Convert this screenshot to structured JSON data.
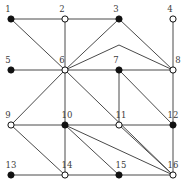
{
  "figure": {
    "width": 194,
    "height": 188,
    "background_color": "#ffffff",
    "edge_color": "#4a4a4a",
    "node_outline_color": "#111111",
    "node_fill_color": "#111111",
    "node_open_color": "#ffffff",
    "label_color": "#3c3c3c"
  },
  "chart_data": {
    "type": "scatter",
    "title": "",
    "xlabel": "",
    "ylabel": "",
    "grid": false,
    "legend": false,
    "nodes": [
      {
        "id": 1,
        "label": "1",
        "x": 11,
        "y": 19,
        "style": "filled",
        "label_dx": -3,
        "label_dy": -7
      },
      {
        "id": 2,
        "label": "2",
        "x": 65,
        "y": 19,
        "style": "open",
        "label_dx": -3,
        "label_dy": -7
      },
      {
        "id": 3,
        "label": "3",
        "x": 119,
        "y": 19,
        "style": "filled",
        "label_dx": -3,
        "label_dy": -7
      },
      {
        "id": 4,
        "label": "4",
        "x": 173,
        "y": 19,
        "style": "open",
        "label_dx": -3,
        "label_dy": -7
      },
      {
        "id": 5,
        "label": "5",
        "x": 11,
        "y": 70,
        "style": "filled",
        "label_dx": -3,
        "label_dy": -7
      },
      {
        "id": 6,
        "label": "6",
        "x": 65,
        "y": 70,
        "style": "open",
        "label_dx": -3,
        "label_dy": -7
      },
      {
        "id": 7,
        "label": "7",
        "x": 119,
        "y": 70,
        "style": "filled",
        "label_dx": -3,
        "label_dy": -7
      },
      {
        "id": 8,
        "label": "8",
        "x": 173,
        "y": 70,
        "style": "open",
        "label_dx": 5,
        "label_dy": -7
      },
      {
        "id": 9,
        "label": "9",
        "x": 11,
        "y": 125,
        "style": "open",
        "label_dx": -3,
        "label_dy": -7
      },
      {
        "id": 10,
        "label": "10",
        "x": 65,
        "y": 125,
        "style": "filled",
        "label_dx": 2,
        "label_dy": -7
      },
      {
        "id": 11,
        "label": "11",
        "x": 119,
        "y": 125,
        "style": "open",
        "label_dx": 2,
        "label_dy": -7
      },
      {
        "id": 12,
        "label": "12",
        "x": 173,
        "y": 125,
        "style": "filled",
        "label_dx": 0,
        "label_dy": -7
      },
      {
        "id": 13,
        "label": "13",
        "x": 11,
        "y": 175,
        "style": "filled",
        "label_dx": 0,
        "label_dy": -7
      },
      {
        "id": 14,
        "label": "14",
        "x": 65,
        "y": 175,
        "style": "open",
        "label_dx": 2,
        "label_dy": -7
      },
      {
        "id": 15,
        "label": "15",
        "x": 119,
        "y": 175,
        "style": "filled",
        "label_dx": 2,
        "label_dy": -7
      },
      {
        "id": 16,
        "label": "16",
        "x": 173,
        "y": 175,
        "style": "open",
        "label_dx": 0,
        "label_dy": -7
      }
    ],
    "edges": [
      {
        "source": 1,
        "target": 2
      },
      {
        "source": 2,
        "target": 3
      },
      {
        "source": 2,
        "target": 6
      },
      {
        "source": 1,
        "target": 6
      },
      {
        "source": 3,
        "target": 6
      },
      {
        "source": 3,
        "target": 8
      },
      {
        "source": 4,
        "target": 8
      },
      {
        "source": 5,
        "target": 6
      },
      {
        "source": 6,
        "target": 7
      },
      {
        "source": 7,
        "target": 8
      },
      {
        "source": 6,
        "target": 8
      },
      {
        "source": 6,
        "target": 9
      },
      {
        "source": 6,
        "target": 10
      },
      {
        "source": 6,
        "target": 16
      },
      {
        "source": 7,
        "target": 11
      },
      {
        "source": 7,
        "target": 12
      },
      {
        "source": 8,
        "target": 12
      },
      {
        "source": 9,
        "target": 10
      },
      {
        "source": 9,
        "target": 14
      },
      {
        "source": 10,
        "target": 11
      },
      {
        "source": 10,
        "target": 14
      },
      {
        "source": 10,
        "target": 15
      },
      {
        "source": 10,
        "target": 16
      },
      {
        "source": 11,
        "target": 12
      },
      {
        "source": 11,
        "target": 16
      },
      {
        "source": 12,
        "target": 16
      },
      {
        "source": 13,
        "target": 14
      },
      {
        "source": 14,
        "target": 15
      },
      {
        "source": 15,
        "target": 16
      }
    ],
    "bend_points": [
      {
        "edge": [
          6,
          8
        ],
        "x": 119,
        "y": 45
      }
    ]
  }
}
